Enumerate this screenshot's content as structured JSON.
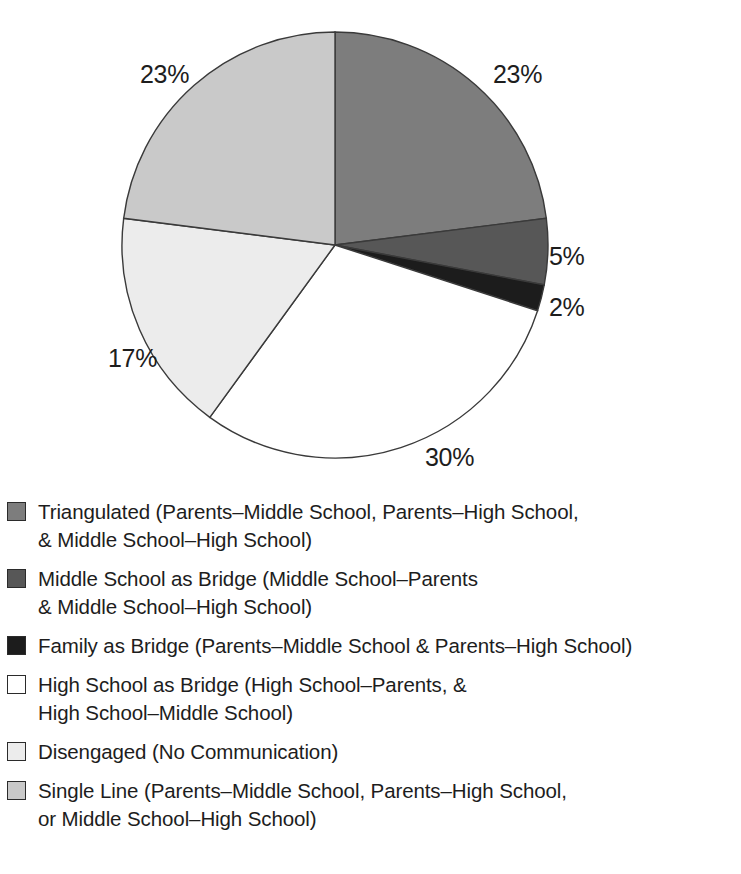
{
  "chart_data": {
    "type": "pie",
    "title": "",
    "subtitle": "",
    "xlabel": "",
    "ylabel": "",
    "grid": false,
    "legend_position": "bottom",
    "start_angle_deg": 0,
    "direction": "clockwise",
    "units": "percent",
    "categories": [
      "Triangulated (Parents–Middle School, Parents–High School, & Middle School–High School)",
      "Middle School as Bridge (Middle School–Parents & Middle School–High School)",
      "Family as Bridge (Parents–Middle School & Parents–High School)",
      "High School as Bridge (High School–Parents, & High School–Middle School)",
      "Disengaged (No Communication)",
      "Single Line (Parents–Middle School, Parents–High School, or Middle School–High School)"
    ],
    "values": [
      23,
      5,
      2,
      30,
      17,
      23
    ],
    "data_labels": [
      "23%",
      "5%",
      "2%",
      "30%",
      "17%",
      "23%"
    ],
    "colors": [
      "#7d7d7d",
      "#575757",
      "#1c1c1c",
      "#ffffff",
      "#ececec",
      "#c9c9c9"
    ],
    "slice_border_color": "#3a3a3a",
    "annotations": []
  },
  "pie": {
    "labels": [
      {
        "text": "23%",
        "left": 140,
        "top": 60
      },
      {
        "text": "23%",
        "left": 493,
        "top": 60
      },
      {
        "text": "5%",
        "left": 549,
        "top": 242
      },
      {
        "text": "2%",
        "left": 549,
        "top": 293
      },
      {
        "text": "30%",
        "left": 425,
        "top": 443
      },
      {
        "text": "17%",
        "left": 108,
        "top": 344
      }
    ]
  },
  "legend": {
    "items": [
      {
        "label": "Triangulated (Parents–Middle School, Parents–High School,\n& Middle School–High School)",
        "color": "#7d7d7d",
        "swatch_name": "legend-swatch-triangulated"
      },
      {
        "label": "Middle School as Bridge (Middle School–Parents\n& Middle School–High School)",
        "color": "#575757",
        "swatch_name": "legend-swatch-middle-school-as-bridge"
      },
      {
        "label": "Family as Bridge (Parents–Middle School & Parents–High School)",
        "color": "#1c1c1c",
        "swatch_name": "legend-swatch-family-as-bridge"
      },
      {
        "label": "High School as Bridge (High School–Parents, &\nHigh School–Middle School)",
        "color": "#ffffff",
        "swatch_name": "legend-swatch-high-school-as-bridge"
      },
      {
        "label": "Disengaged (No Communication)",
        "color": "#ececec",
        "swatch_name": "legend-swatch-disengaged"
      },
      {
        "label": "Single Line (Parents–Middle School, Parents–High School,\nor Middle School–High School)",
        "color": "#c9c9c9",
        "swatch_name": "legend-swatch-single-line"
      }
    ]
  }
}
